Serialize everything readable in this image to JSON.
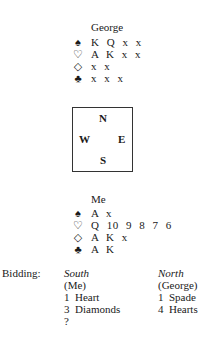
{
  "north_hand": {
    "player": "George",
    "suits": [
      {
        "suit": "spades",
        "symbol": "♠",
        "cards": "K Q x x"
      },
      {
        "suit": "hearts",
        "symbol": "♡",
        "cards": "A K x x"
      },
      {
        "suit": "diamonds",
        "symbol": "◇",
        "cards": "x x"
      },
      {
        "suit": "clubs",
        "symbol": "♣",
        "cards": "x x x"
      }
    ]
  },
  "compass": {
    "north": "N",
    "west": "W",
    "east": "E",
    "south": "S"
  },
  "south_hand": {
    "player": "Me",
    "suits": [
      {
        "suit": "spades",
        "symbol": "♠",
        "cards": "A x"
      },
      {
        "suit": "hearts",
        "symbol": "♡",
        "cards": "Q 10 9 8 7 6"
      },
      {
        "suit": "diamonds",
        "symbol": "◇",
        "cards": "A K x"
      },
      {
        "suit": "clubs",
        "symbol": "♣",
        "cards": "A K"
      }
    ]
  },
  "bidding": {
    "label": "Bidding:",
    "south": {
      "seat": "South",
      "player": "(Me)",
      "bids": [
        "1  Heart",
        "3  Diamonds",
        "?"
      ]
    },
    "north": {
      "seat": "North",
      "player": "(George)",
      "bids": [
        "1  Spade",
        "4  Hearts"
      ]
    }
  }
}
